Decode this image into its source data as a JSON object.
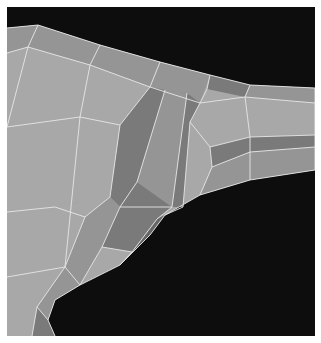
{
  "viewport": {
    "label": "3D mesh wireframe render",
    "background_color": "#0d0d0d",
    "edge_color": "#e6e6e6",
    "shade_colors": {
      "light": "#a8a8a8",
      "mid": "#959595",
      "dark": "#7a7a7a",
      "darker": "#666666"
    }
  }
}
